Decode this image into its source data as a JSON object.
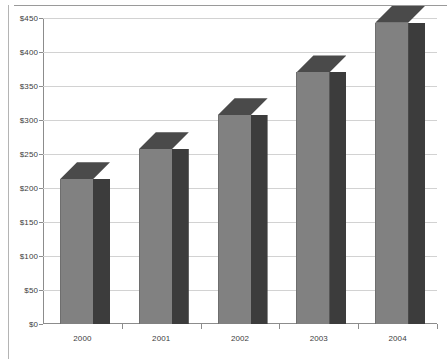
{
  "chart_data": {
    "type": "bar",
    "title": "",
    "subtitle": "",
    "xlabel": "",
    "ylabel": "",
    "categories": [
      "2000",
      "2001",
      "2002",
      "2003",
      "2004"
    ],
    "values": [
      213,
      257,
      307,
      370,
      443
    ],
    "ylim": [
      0,
      450
    ],
    "y_ticks": [
      0,
      50,
      100,
      150,
      200,
      250,
      300,
      350,
      400,
      450
    ],
    "y_tick_labels": [
      "$0",
      "$50",
      "$100",
      "$150",
      "$200",
      "$250",
      "$300",
      "$350",
      "$400",
      "$450"
    ],
    "grid": true,
    "legend": false,
    "legend_position": "none",
    "series": [
      {
        "name": "",
        "values": [
          213,
          257,
          307,
          370,
          443
        ]
      }
    ],
    "style": {
      "three_d": true,
      "bar_face_color": "#818181",
      "bar_side_color": "#3c3c3c",
      "bar_top_color": "#4a4a4a",
      "gridline_color": "#d2d2d2",
      "axis_color": "#8c8c8c",
      "text_color": "#3d3d3d",
      "background_color": "#ffffff"
    }
  }
}
